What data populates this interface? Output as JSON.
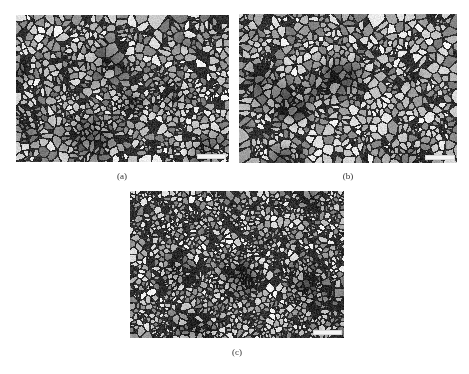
{
  "figure": {
    "panels": [
      {
        "id": "a",
        "label": "(a)",
        "seed": 11,
        "grain": 4.2,
        "x": 16,
        "y": 15,
        "w": 213,
        "h": 147,
        "label_x": 107,
        "label_y": 171,
        "scalebar": {
          "x": 197,
          "y": 154,
          "w": 27
        }
      },
      {
        "id": "b",
        "label": "(b)",
        "seed": 29,
        "grain": 4.6,
        "x": 239,
        "y": 14,
        "w": 218,
        "h": 149,
        "label_x": 333,
        "label_y": 171,
        "scalebar": {
          "x": 425,
          "y": 155,
          "w": 28
        }
      },
      {
        "id": "c",
        "label": "(c)",
        "seed": 47,
        "grain": 3.2,
        "x": 130,
        "y": 191,
        "w": 214,
        "h": 147,
        "label_x": 222,
        "label_y": 347,
        "scalebar": {
          "x": 313,
          "y": 330,
          "w": 27
        }
      }
    ]
  }
}
